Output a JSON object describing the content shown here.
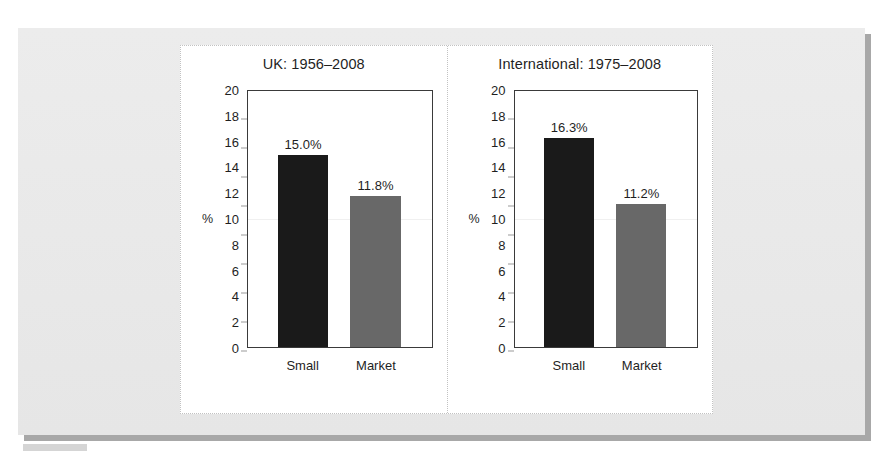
{
  "figure": {
    "panel_background": "#e8e8e8",
    "shadow_color": "#a8a8a8",
    "axis_unit_label": "%"
  },
  "chart_data": {
    "type": "bar",
    "title": "",
    "panels": [
      {
        "title": "UK: 1956–2008",
        "categories": [
          "Small",
          "Market"
        ],
        "values": [
          15.0,
          11.8
        ],
        "labels": [
          "15.0%",
          "11.8%"
        ],
        "colors": [
          "#1a1a1a",
          "#686868"
        ],
        "ylabel": "%",
        "ylim": [
          0,
          20
        ],
        "yticks": [
          20,
          18,
          16,
          14,
          12,
          10,
          8,
          6,
          4,
          2,
          0
        ],
        "grid": false
      },
      {
        "title": "International: 1975–2008",
        "categories": [
          "Small",
          "Market"
        ],
        "values": [
          16.3,
          11.2
        ],
        "labels": [
          "16.3%",
          "11.2%"
        ],
        "colors": [
          "#1a1a1a",
          "#686868"
        ],
        "ylabel": "%",
        "ylim": [
          0,
          20
        ],
        "yticks": [
          20,
          18,
          16,
          14,
          12,
          10,
          8,
          6,
          4,
          2,
          0
        ],
        "grid": false
      }
    ],
    "xlabel": "",
    "ylabel": "%",
    "ylim": [
      0,
      20
    ],
    "legend": null,
    "legend_position": "none"
  }
}
